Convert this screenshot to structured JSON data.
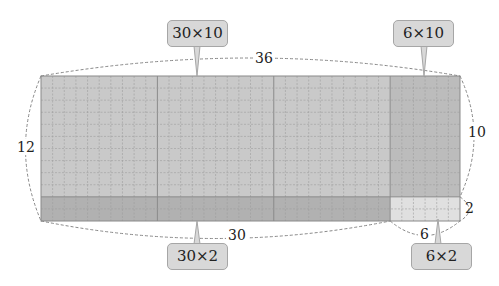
{
  "diagram": {
    "total_width": 36,
    "total_height": 12,
    "split_width": [
      30,
      6
    ],
    "split_height": [
      10,
      2
    ],
    "colors": {
      "region_30x10": "#c9c9c9",
      "region_6x10": "#bcbcbc",
      "region_30x2": "#b1b1b1",
      "region_6x2": "#e0e0e0",
      "grid_minor": "#9e9e9e",
      "grid_major": "#8a8a8a",
      "callout_fill": "#d8d8d8",
      "callout_border": "#a6a6a6",
      "dim_line": "#888888"
    },
    "callouts": {
      "top_left": "30×10",
      "top_right": "6×10",
      "bottom_left": "30×2",
      "bottom_right": "6×2"
    },
    "dimensions": {
      "top": "36",
      "left": "12",
      "right_upper": "10",
      "right_lower": "2",
      "bottom_left": "30",
      "bottom_right": "6"
    }
  }
}
